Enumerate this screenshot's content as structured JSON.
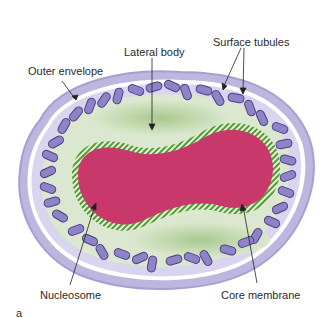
{
  "figure": {
    "panel_label": "a",
    "labels": {
      "outer_envelope": "Outer envelope",
      "lateral_body": "Lateral body",
      "surface_tubules": "Surface tubules",
      "nucleosome": "Nucleosome",
      "core_membrane": "Core membrane"
    },
    "colors": {
      "outer_envelope": "#b9b3db",
      "tubules": "#8b80c4",
      "tubule_outline": "#4b3f86",
      "lateral_body": "#b9d3a3",
      "lateral_body_fill": "#d4e4c6",
      "core_membrane_stripe": "#4f9a32",
      "nucleosome": "#c8386b"
    }
  }
}
